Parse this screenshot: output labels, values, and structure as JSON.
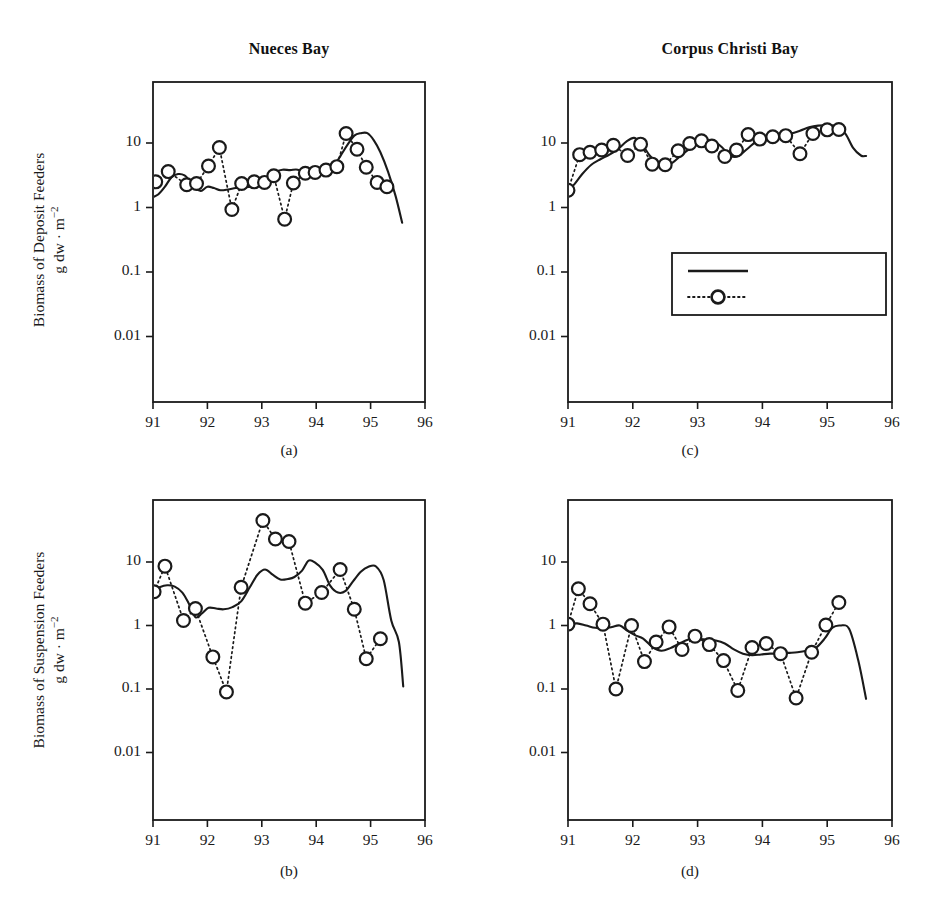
{
  "figure": {
    "background": "#ffffff",
    "line_color": "#1a1a1a",
    "marker_fill": "#ffffff"
  },
  "titles": {
    "left": "Nueces Bay",
    "right": "Corpus Christi Bay"
  },
  "y_axis_labels": {
    "top": {
      "line1": "Biomass of Deposit Feeders",
      "line2": "g dw · m",
      "exponent": "−2"
    },
    "bottom": {
      "line1": "Biomass of Suspension Feeders",
      "line2": "g dw · m",
      "exponent": "−2"
    }
  },
  "legend": {
    "position": "inside-panel-c",
    "entries": [
      {
        "label": "Simulation",
        "style": "solid-line"
      },
      {
        "label": "Observation",
        "style": "dotted-line-open-circle"
      }
    ]
  },
  "panel_letters": {
    "a": "(a)",
    "b": "(b)",
    "c": "(c)",
    "d": "(d)"
  },
  "chart_data": [
    {
      "id": "a",
      "panel_label": "(a)",
      "type": "line",
      "title": "Nueces Bay",
      "xlabel": "",
      "ylabel": "Biomass of Deposit Feeders g dw · m⁻²",
      "xlim": [
        91,
        96
      ],
      "ylim": [
        0.003,
        40
      ],
      "yscale": "log",
      "xticks": [
        91,
        92,
        93,
        94,
        95,
        96
      ],
      "xticklabels": [
        "91",
        "92",
        "93",
        "94",
        "95",
        "96"
      ],
      "yticks": [
        10,
        1,
        0.1,
        0.01
      ],
      "yticklabels": [
        "10",
        "1",
        "0.1",
        "0.01"
      ],
      "grid": false,
      "series": [
        {
          "name": "Simulation",
          "style": "solid",
          "x": [
            91.0,
            91.1,
            91.22,
            91.34,
            91.46,
            91.58,
            91.68,
            91.78,
            91.88,
            92.0,
            92.12,
            92.24,
            92.38,
            92.52,
            92.66,
            92.8,
            92.96,
            93.1,
            93.24,
            93.38,
            93.52,
            93.66,
            93.8,
            93.94,
            94.06,
            94.2,
            94.34,
            94.46,
            94.58,
            94.7,
            94.82,
            94.94,
            95.06,
            95.18,
            95.32,
            95.46,
            95.58
          ],
          "y": [
            1.45,
            1.6,
            2.1,
            2.95,
            3.3,
            3.15,
            2.55,
            2.0,
            1.8,
            2.1,
            2.0,
            1.85,
            1.9,
            2.0,
            2.05,
            2.1,
            2.3,
            2.9,
            3.55,
            3.85,
            3.8,
            3.85,
            3.35,
            2.95,
            3.15,
            3.6,
            4.6,
            6.6,
            9.5,
            13.0,
            14.2,
            14.2,
            11.0,
            7.2,
            3.6,
            1.5,
            0.58
          ]
        },
        {
          "name": "Observation",
          "style": "dotted",
          "marker": "open-circle",
          "x": [
            91.05,
            91.28,
            91.62,
            91.8,
            92.02,
            92.22,
            92.45,
            92.63,
            92.86,
            93.05,
            93.22,
            93.42,
            93.58,
            93.8,
            93.98,
            94.18,
            94.38,
            94.55,
            94.75,
            94.92,
            95.12,
            95.3
          ],
          "y": [
            2.5,
            3.6,
            2.25,
            2.35,
            4.4,
            8.5,
            0.93,
            2.35,
            2.5,
            2.45,
            3.1,
            0.66,
            2.4,
            3.4,
            3.5,
            3.8,
            4.3,
            14.0,
            8.0,
            4.2,
            2.45,
            2.1
          ]
        }
      ]
    },
    {
      "id": "b",
      "panel_label": "(b)",
      "type": "line",
      "title": "Nueces Bay",
      "xlabel": "",
      "ylabel": "Biomass of Suspension Feeders g dw · m⁻²",
      "xlim": [
        91,
        96
      ],
      "ylim": [
        0.003,
        70
      ],
      "yscale": "log",
      "xticks": [
        91,
        92,
        93,
        94,
        95,
        96
      ],
      "xticklabels": [
        "91",
        "92",
        "93",
        "94",
        "95",
        "96"
      ],
      "yticks": [
        10,
        1,
        0.1,
        0.01
      ],
      "yticklabels": [
        "10",
        "1",
        "0.1",
        "0.01"
      ],
      "grid": false,
      "series": [
        {
          "name": "Simulation",
          "style": "solid",
          "x": [
            91.0,
            91.12,
            91.26,
            91.4,
            91.54,
            91.66,
            91.78,
            91.9,
            92.02,
            92.16,
            92.3,
            92.46,
            92.62,
            92.78,
            92.92,
            93.06,
            93.2,
            93.34,
            93.48,
            93.6,
            93.74,
            93.86,
            93.98,
            94.12,
            94.26,
            94.4,
            94.54,
            94.68,
            94.82,
            94.96,
            95.1,
            95.24,
            95.38,
            95.52,
            95.6
          ],
          "y": [
            3.5,
            4.0,
            4.3,
            4.1,
            3.3,
            2.2,
            1.35,
            1.55,
            1.9,
            1.85,
            1.8,
            1.95,
            2.4,
            4.0,
            6.3,
            7.6,
            6.3,
            5.3,
            5.4,
            5.8,
            7.3,
            10.5,
            9.8,
            7.5,
            4.2,
            3.3,
            3.5,
            5.0,
            7.0,
            8.4,
            8.5,
            5.2,
            1.2,
            0.55,
            0.11
          ]
        },
        {
          "name": "Observation",
          "style": "dotted",
          "marker": "open-circle",
          "x": [
            91.02,
            91.22,
            91.56,
            91.78,
            92.1,
            92.35,
            92.62,
            93.02,
            93.25,
            93.5,
            93.8,
            94.1,
            94.44,
            94.7,
            94.92,
            95.18
          ],
          "y": [
            3.4,
            8.6,
            1.2,
            1.85,
            0.32,
            0.09,
            4.0,
            45.0,
            23.0,
            21.0,
            2.25,
            3.3,
            7.6,
            1.8,
            0.3,
            0.62
          ]
        }
      ]
    },
    {
      "id": "c",
      "panel_label": "(c)",
      "type": "line",
      "title": "Corpus Christi Bay",
      "xlabel": "",
      "ylabel": "Biomass of Deposit Feeders g dw · m⁻²",
      "xlim": [
        91,
        96
      ],
      "ylim": [
        0.003,
        40
      ],
      "yscale": "log",
      "xticks": [
        91,
        92,
        93,
        94,
        95,
        96
      ],
      "xticklabels": [
        "91",
        "92",
        "93",
        "94",
        "95",
        "96"
      ],
      "yticks": [
        10,
        1,
        0.1,
        0.01
      ],
      "yticklabels": [
        "10",
        "1",
        "0.1",
        "0.01"
      ],
      "grid": false,
      "series": [
        {
          "name": "Simulation",
          "style": "solid",
          "x": [
            91.0,
            91.1,
            91.22,
            91.36,
            91.5,
            91.64,
            91.78,
            91.9,
            92.02,
            92.14,
            92.26,
            92.38,
            92.5,
            92.62,
            92.76,
            92.9,
            93.02,
            93.14,
            93.26,
            93.38,
            93.5,
            93.62,
            93.76,
            93.9,
            94.02,
            94.16,
            94.3,
            94.44,
            94.58,
            94.72,
            94.86,
            95.0,
            95.14,
            95.28,
            95.4,
            95.52,
            95.6
          ],
          "y": [
            1.85,
            2.3,
            3.3,
            4.6,
            5.6,
            6.6,
            8.2,
            10.5,
            12.0,
            9.6,
            6.4,
            4.9,
            4.4,
            5.0,
            6.6,
            8.4,
            9.8,
            11.0,
            10.5,
            8.5,
            6.4,
            6.2,
            8.0,
            10.5,
            12.5,
            13.6,
            13.4,
            14.0,
            15.5,
            17.5,
            18.6,
            18.8,
            18.0,
            14.0,
            8.4,
            6.4,
            6.3
          ]
        },
        {
          "name": "Observation",
          "style": "dotted",
          "marker": "open-circle",
          "x": [
            91.0,
            91.18,
            91.34,
            91.52,
            91.7,
            91.92,
            92.12,
            92.3,
            92.5,
            92.7,
            92.88,
            93.06,
            93.22,
            93.42,
            93.6,
            93.78,
            93.96,
            94.16,
            94.36,
            94.58,
            94.78,
            95.0,
            95.18
          ],
          "y": [
            1.85,
            6.6,
            7.2,
            7.8,
            9.2,
            6.4,
            9.6,
            4.7,
            4.6,
            7.6,
            9.8,
            10.8,
            9.0,
            6.2,
            7.8,
            13.5,
            11.5,
            12.5,
            13.0,
            6.8,
            14.0,
            16.0,
            16.2
          ]
        }
      ]
    },
    {
      "id": "d",
      "panel_label": "(d)",
      "type": "line",
      "title": "Corpus Christi Bay",
      "xlabel": "",
      "ylabel": "Biomass of Suspension Feeders g dw · m⁻²",
      "xlim": [
        91,
        96
      ],
      "ylim": [
        0.003,
        70
      ],
      "yscale": "log",
      "xticks": [
        91,
        92,
        93,
        94,
        95,
        96
      ],
      "xticklabels": [
        "91",
        "92",
        "93",
        "94",
        "95",
        "96"
      ],
      "yticks": [
        10,
        1,
        0.1,
        0.01
      ],
      "yticklabels": [
        "10",
        "1",
        "0.1",
        "0.01"
      ],
      "grid": false,
      "series": [
        {
          "name": "Simulation",
          "style": "solid",
          "x": [
            91.0,
            91.14,
            91.28,
            91.42,
            91.56,
            91.68,
            91.8,
            91.92,
            92.04,
            92.16,
            92.3,
            92.44,
            92.58,
            92.72,
            92.86,
            93.0,
            93.14,
            93.28,
            93.42,
            93.56,
            93.7,
            93.84,
            93.98,
            94.12,
            94.26,
            94.4,
            94.54,
            94.68,
            94.82,
            94.96,
            95.08,
            95.2,
            95.34,
            95.48,
            95.6
          ],
          "y": [
            1.05,
            1.08,
            1.0,
            0.92,
            0.9,
            0.95,
            1.0,
            0.82,
            0.7,
            0.62,
            0.46,
            0.4,
            0.44,
            0.52,
            0.6,
            0.62,
            0.6,
            0.58,
            0.52,
            0.42,
            0.36,
            0.34,
            0.35,
            0.36,
            0.36,
            0.37,
            0.38,
            0.4,
            0.44,
            0.62,
            0.92,
            1.0,
            0.88,
            0.28,
            0.07
          ]
        },
        {
          "name": "Observation",
          "style": "dotted",
          "marker": "open-circle",
          "x": [
            91.0,
            91.16,
            91.34,
            91.54,
            91.74,
            91.98,
            92.18,
            92.36,
            92.56,
            92.76,
            92.96,
            93.18,
            93.4,
            93.62,
            93.84,
            94.06,
            94.28,
            94.52,
            94.76,
            94.98,
            95.18
          ],
          "y": [
            1.05,
            3.8,
            2.2,
            1.05,
            0.1,
            1.0,
            0.27,
            0.55,
            0.95,
            0.42,
            0.68,
            0.5,
            0.28,
            0.095,
            0.45,
            0.52,
            0.36,
            0.072,
            0.38,
            1.02,
            2.3
          ]
        }
      ]
    }
  ]
}
